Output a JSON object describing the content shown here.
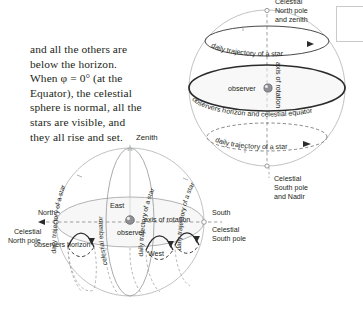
{
  "page": {
    "width": 354,
    "height": 318,
    "background": "#ffffff",
    "ink": "#231f20"
  },
  "prose": {
    "lines": [
      "and all the others are",
      "below the horizon.",
      "When φ = 0° (at the",
      "Equator), the celestial",
      "sphere is normal, all the",
      "stars are visible, and",
      "they all rise and set."
    ]
  },
  "figures": {
    "top_sphere": {
      "name": "equatorial-celestial-sphere-perspective",
      "labels": {
        "north_pole": [
          "Celestial",
          "North pole",
          "and zenith"
        ],
        "upper_trajectory": "daily trajectory of a star",
        "lower_trajectory": "daily trajectory of a star",
        "observer": "observer",
        "axis": "axis of rotation",
        "horizon": "observers horizon and celestial equator",
        "south_pole": [
          "Celestial",
          "South pole",
          "and Nadir"
        ]
      }
    },
    "bottom_sphere": {
      "name": "equatorial-celestial-sphere-side",
      "labels": {
        "zenith": "Zenith",
        "north": "North",
        "north_pole": [
          "Celestial",
          "North pole"
        ],
        "south": "South",
        "south_pole": [
          "Celestial",
          "South pole"
        ],
        "east": "East",
        "west": "West",
        "observer": "observer",
        "axis": "axis of rotation",
        "horizon": "observers horizon",
        "celestial_equator": "celestial equator",
        "trajectory_left": "daily trajectory of a star",
        "trajectory_mid": "daily trajectory of a star",
        "trajectory_right": "daily trajectory of a star"
      }
    }
  },
  "colors": {
    "ink": "#231f20",
    "sphere_outline": "#b9bbbd",
    "horizon_stroke": "#2b2b2b",
    "dash_gray": "#8d8f91",
    "fill_gray": "#f2f2f2"
  }
}
